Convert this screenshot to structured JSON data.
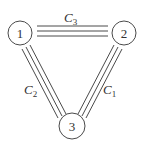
{
  "diagram": {
    "type": "graph",
    "colors": {
      "ink": "#4a4a4a",
      "text": "#333333",
      "background": "#ffffff"
    },
    "nodes": [
      {
        "id": "1",
        "label": "1",
        "cx": 20,
        "cy": 33,
        "r": 12
      },
      {
        "id": "2",
        "label": "2",
        "cx": 124,
        "cy": 33,
        "r": 12
      },
      {
        "id": "3",
        "label": "3",
        "cx": 72,
        "cy": 126,
        "r": 13
      }
    ],
    "edges": [
      {
        "id": "C3",
        "from": "1",
        "to": "2",
        "label_main": "C",
        "label_sub": "3",
        "line_count": 3,
        "label_x": 64,
        "label_y": 22
      },
      {
        "id": "C2",
        "from": "1",
        "to": "3",
        "label_main": "C",
        "label_sub": "2",
        "line_count": 3,
        "label_x": 24,
        "label_y": 94
      },
      {
        "id": "C1",
        "from": "2",
        "to": "3",
        "label_main": "C",
        "label_sub": "1",
        "line_count": 3,
        "label_x": 103,
        "label_y": 94
      }
    ]
  }
}
